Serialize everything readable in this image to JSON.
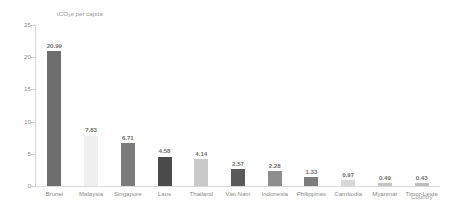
{
  "chart_data": {
    "type": "bar",
    "title": "",
    "ylabel": "tCO₂e per capita",
    "xlabel": "Country",
    "ylim": [
      0,
      25
    ],
    "yticks": [
      "0",
      "5",
      "10",
      "15",
      "20",
      "25"
    ],
    "grid": false,
    "legend": "none",
    "categories": [
      "Brunei",
      "Malaysia",
      "Singapore",
      "Laos",
      "Thailand",
      "Viet Nam",
      "Indonesia",
      "Philippines",
      "Cambodia",
      "Myanmar",
      "Timor-Leste"
    ],
    "values": [
      20.99,
      7.83,
      6.71,
      4.58,
      4.14,
      2.57,
      2.28,
      1.33,
      0.97,
      0.49,
      0.43
    ],
    "value_labels": [
      "20.99",
      "7.83",
      "6.71",
      "4.58",
      "4.14",
      "2.57",
      "2.28",
      "1.33",
      "0.97",
      "0.49",
      "0.43"
    ],
    "bar_colors": [
      "#6e6e6e",
      "#efefef",
      "#7b7b7b",
      "#4b4b4b",
      "#c9c9c9",
      "#5a5a5a",
      "#8e8e8e",
      "#7d7d7d",
      "#d8d8d8",
      "#c5c5c5",
      "#bdbdbd"
    ]
  },
  "colors": {
    "axis": "#d4d4d4",
    "tick_text": "#8d8d8d",
    "label_text": "#8a8a8a",
    "value_text": "#6f6f6f",
    "background": "#ffffff"
  }
}
